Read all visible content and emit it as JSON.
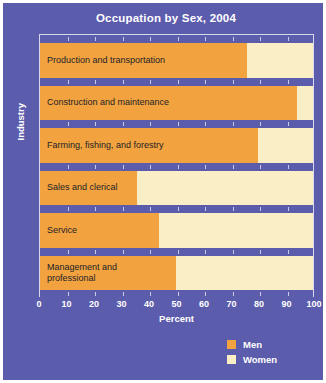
{
  "chart_data": {
    "type": "bar",
    "orientation": "horizontal",
    "stacked": true,
    "stack_total": 100,
    "title": "Occupation by Sex, 2004",
    "xlabel": "Percent",
    "ylabel": "Industry",
    "xlim": [
      0,
      100
    ],
    "xticks": [
      0,
      10,
      20,
      30,
      40,
      50,
      60,
      70,
      80,
      90,
      100
    ],
    "xtick_labels": [
      "0",
      "10",
      "20",
      "30",
      "40",
      "50",
      "60",
      "70",
      "80",
      "90",
      "100"
    ],
    "grid": false,
    "legend_position": "bottom-right",
    "categories": [
      "Production and transportation",
      "Construction and maintenance",
      "Farming, fishing, and forestry",
      "Sales and clerical",
      "Service",
      "Management and\nprofessional"
    ],
    "series": [
      {
        "name": "Men",
        "color": "#f2a33f",
        "values": [
          76,
          94,
          80,
          36,
          44,
          50
        ]
      },
      {
        "name": "Women",
        "color": "#f9eec6",
        "values": [
          24,
          6,
          20,
          64,
          56,
          50
        ]
      }
    ],
    "legend": [
      {
        "label": "Men",
        "color": "#f2a33f"
      },
      {
        "label": "Women",
        "color": "#f9eec6"
      }
    ]
  },
  "colors": {
    "background": "#5c5cad",
    "men": "#f2a33f",
    "women": "#f9eec6",
    "text_on_background": "#ffffff",
    "bar_label_text": "#1d1d28",
    "plot_border": "#d8d8ee",
    "tick_dot": "#c9c9e8",
    "figure_border": "#ffffff"
  }
}
